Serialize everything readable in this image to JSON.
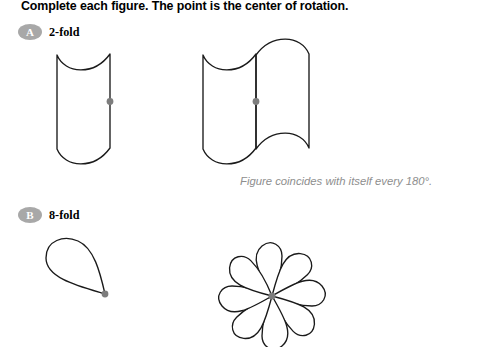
{
  "worksheet": {
    "instruction": "Complete each figure. The point is the center of rotation.",
    "caption": "Figure coincides with itself every 180°.",
    "background_color": "#ffffff",
    "ink_color": "#1a1a1a",
    "badge_color": "#a8a8a8",
    "dot_color": "#7d7d7d",
    "caption_color": "#8e8e8e"
  },
  "parts": [
    {
      "badge": "A",
      "label": "2-fold",
      "given_figure_name": "half-flag-wave-shape",
      "completed_figure_name": "two-fold-flag-wave-shape",
      "rotation_degrees": 180,
      "fold_count": 2
    },
    {
      "badge": "B",
      "label": "8-fold",
      "given_figure_name": "single-teardrop-petal",
      "completed_figure_name": "eight-petal-rosette",
      "rotation_degrees": 45,
      "fold_count": 8
    }
  ],
  "center_points": {
    "part_a_given": "center-of-rotation-dot",
    "part_a_completed": "center-of-rotation-dot",
    "part_b_given": "center-of-rotation-dot",
    "part_b_completed": "center-of-rotation-dot"
  }
}
